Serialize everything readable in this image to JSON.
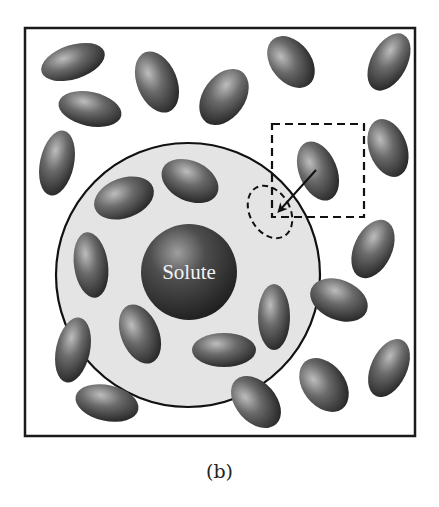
{
  "figure": {
    "caption": "(b)",
    "solute_label": "Solute",
    "colors": {
      "frame": "#1a1a1a",
      "shell_fill": "#e4e4e4",
      "molecule_light": "#b8b8b8",
      "molecule_dark": "#2e2e2e",
      "solute_light": "#9a9a9a",
      "solute_dark": "#262626"
    },
    "frame": {
      "x": 25,
      "y": 28,
      "width": 390,
      "height": 408
    },
    "solvation_shell": {
      "cx": 188,
      "cy": 275,
      "r": 132
    },
    "solute": {
      "cx": 189,
      "cy": 272,
      "r": 48
    },
    "highlight_box": {
      "x": 272,
      "y": 124,
      "width": 92,
      "height": 93
    },
    "vacancy": {
      "cx": 270,
      "cy": 212,
      "rx": 20,
      "ry": 28,
      "rotate": -30
    },
    "arrow": {
      "x1": 316,
      "y1": 170,
      "x2": 280,
      "y2": 210
    },
    "molecules": [
      {
        "cx": 73,
        "cy": 62,
        "rx": 33,
        "ry": 17,
        "rotate": -18
      },
      {
        "cx": 90,
        "cy": 109,
        "rx": 32,
        "ry": 17,
        "rotate": 12
      },
      {
        "cx": 157,
        "cy": 82,
        "rx": 20,
        "ry": 32,
        "rotate": -22
      },
      {
        "cx": 224,
        "cy": 97,
        "rx": 21,
        "ry": 31,
        "rotate": 35
      },
      {
        "cx": 291,
        "cy": 62,
        "rx": 20,
        "ry": 29,
        "rotate": -38
      },
      {
        "cx": 389,
        "cy": 62,
        "rx": 18,
        "ry": 31,
        "rotate": 28
      },
      {
        "cx": 57,
        "cy": 163,
        "rx": 17,
        "ry": 33,
        "rotate": 12
      },
      {
        "cx": 124,
        "cy": 198,
        "rx": 31,
        "ry": 20,
        "rotate": -20
      },
      {
        "cx": 190,
        "cy": 181,
        "rx": 30,
        "ry": 20,
        "rotate": 25
      },
      {
        "cx": 318,
        "cy": 171,
        "rx": 19,
        "ry": 31,
        "rotate": -22
      },
      {
        "cx": 388,
        "cy": 148,
        "rx": 19,
        "ry": 30,
        "rotate": -20
      },
      {
        "cx": 91,
        "cy": 265,
        "rx": 17,
        "ry": 33,
        "rotate": -8
      },
      {
        "cx": 373,
        "cy": 249,
        "rx": 19,
        "ry": 31,
        "rotate": 25
      },
      {
        "cx": 140,
        "cy": 334,
        "rx": 19,
        "ry": 31,
        "rotate": -22
      },
      {
        "cx": 274,
        "cy": 317,
        "rx": 16,
        "ry": 33,
        "rotate": 0
      },
      {
        "cx": 339,
        "cy": 300,
        "rx": 30,
        "ry": 20,
        "rotate": 22
      },
      {
        "cx": 73,
        "cy": 350,
        "rx": 17,
        "ry": 33,
        "rotate": 12
      },
      {
        "cx": 224,
        "cy": 350,
        "rx": 32,
        "ry": 17,
        "rotate": 0
      },
      {
        "cx": 107,
        "cy": 403,
        "rx": 32,
        "ry": 18,
        "rotate": 12
      },
      {
        "cx": 256,
        "cy": 402,
        "rx": 20,
        "ry": 30,
        "rotate": -42
      },
      {
        "cx": 324,
        "cy": 385,
        "rx": 21,
        "ry": 30,
        "rotate": -38
      },
      {
        "cx": 389,
        "cy": 368,
        "rx": 18,
        "ry": 31,
        "rotate": 25
      }
    ]
  }
}
